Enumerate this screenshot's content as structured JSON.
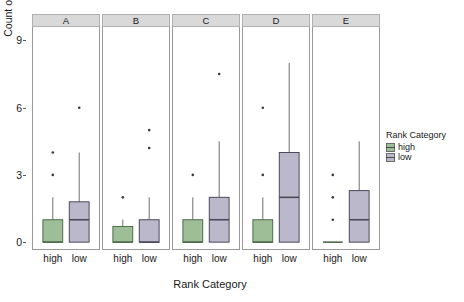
{
  "chart_data": {
    "type": "box",
    "title": "",
    "xlabel": "Rank Category",
    "ylabel": "Count of Traumas",
    "ylim": [
      -0.35,
      9.6
    ],
    "yticks": [
      0,
      3,
      6,
      9
    ],
    "ytick_labels": [
      "0",
      "3",
      "6",
      "9"
    ],
    "grid": false,
    "facet_labels": [
      "A",
      "B",
      "C",
      "D",
      "E"
    ],
    "categories": [
      "high",
      "low"
    ],
    "legend": {
      "title": "Rank Category",
      "position": "right",
      "entries": [
        {
          "label": "high",
          "color": "#9dbe97"
        },
        {
          "label": "low",
          "color": "#bbb8cb"
        }
      ]
    },
    "panels": [
      {
        "facet": "A",
        "boxes": [
          {
            "group": "high",
            "color": "#9dbe97",
            "min": 0,
            "q1": 0,
            "median": 0,
            "q3": 1.0,
            "max": 2.0,
            "outliers": [
              3,
              4
            ]
          },
          {
            "group": "low",
            "color": "#bbb8cb",
            "min": 0,
            "q1": 0,
            "median": 1.0,
            "q3": 1.8,
            "max": 4.0,
            "outliers": [
              6
            ]
          }
        ]
      },
      {
        "facet": "B",
        "boxes": [
          {
            "group": "high",
            "color": "#9dbe97",
            "min": 0,
            "q1": 0,
            "median": 0,
            "q3": 0.7,
            "max": 1.0,
            "outliers": [
              2
            ]
          },
          {
            "group": "low",
            "color": "#bbb8cb",
            "min": 0,
            "q1": 0,
            "median": 0,
            "q3": 1.0,
            "max": 2.0,
            "outliers": [
              4.2,
              5.0
            ]
          }
        ]
      },
      {
        "facet": "C",
        "boxes": [
          {
            "group": "high",
            "color": "#9dbe97",
            "min": 0,
            "q1": 0,
            "median": 0,
            "q3": 1.0,
            "max": 2.0,
            "outliers": [
              3
            ]
          },
          {
            "group": "low",
            "color": "#bbb8cb",
            "min": 0,
            "q1": 0,
            "median": 1.0,
            "q3": 2.0,
            "max": 4.5,
            "outliers": [
              7.5
            ]
          }
        ]
      },
      {
        "facet": "D",
        "boxes": [
          {
            "group": "high",
            "color": "#9dbe97",
            "min": 0,
            "q1": 0,
            "median": 0,
            "q3": 1.0,
            "max": 2.0,
            "outliers": [
              3,
              6
            ]
          },
          {
            "group": "low",
            "color": "#bbb8cb",
            "min": 0,
            "q1": 0,
            "median": 2.0,
            "q3": 4.0,
            "max": 8.0,
            "outliers": []
          }
        ]
      },
      {
        "facet": "E",
        "boxes": [
          {
            "group": "high",
            "color": "#9dbe97",
            "min": 0,
            "q1": 0,
            "median": 0,
            "q3": 0,
            "max": 0,
            "outliers": [
              1,
              2,
              3
            ]
          },
          {
            "group": "low",
            "color": "#bbb8cb",
            "min": 0,
            "q1": 0,
            "median": 1.0,
            "q3": 2.3,
            "max": 4.5,
            "outliers": []
          }
        ]
      }
    ]
  }
}
